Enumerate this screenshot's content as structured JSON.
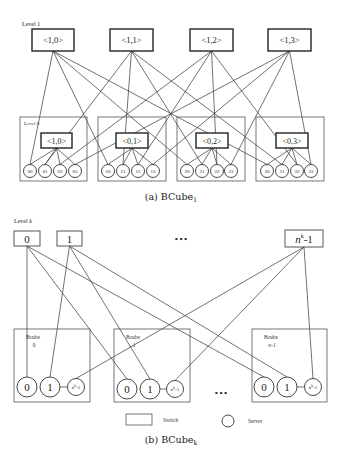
{
  "figure_a": {
    "caption": "(a) BCube",
    "caption_sub": "1",
    "level1_label": "Level 1",
    "level0_label": "Level 0",
    "level1_switches": [
      {
        "label": "<1,0>",
        "x": 32,
        "y": 29,
        "w": 42,
        "h": 22
      },
      {
        "label": "<1,1>",
        "x": 110,
        "y": 29,
        "w": 43,
        "h": 22
      },
      {
        "label": "<1,2>",
        "x": 190,
        "y": 29,
        "w": 43,
        "h": 22
      },
      {
        "label": "<1,3>",
        "x": 268,
        "y": 29,
        "w": 43,
        "h": 22
      }
    ],
    "cells": [
      {
        "box": {
          "x": 20,
          "y": 117,
          "w": 67,
          "h": 64
        },
        "switch": {
          "label": "<1,0>",
          "x": 41,
          "y": 133,
          "w": 31,
          "h": 15
        },
        "servers": [
          {
            "label": "00",
            "cx": 30
          },
          {
            "label": "01",
            "cx": 45
          },
          {
            "label": "02",
            "cx": 60
          },
          {
            "label": "03",
            "cx": 75
          }
        ]
      },
      {
        "box": {
          "x": 98,
          "y": 117,
          "w": 68,
          "h": 64
        },
        "switch": {
          "label": "<0,1>",
          "x": 116,
          "y": 133,
          "w": 32,
          "h": 15
        },
        "servers": [
          {
            "label": "10",
            "cx": 108
          },
          {
            "label": "11",
            "cx": 123
          },
          {
            "label": "12",
            "cx": 138
          },
          {
            "label": "13",
            "cx": 153
          }
        ]
      },
      {
        "box": {
          "x": 177,
          "y": 117,
          "w": 68,
          "h": 64
        },
        "switch": {
          "label": "<0,2>",
          "x": 196,
          "y": 133,
          "w": 32,
          "h": 15
        },
        "servers": [
          {
            "label": "20",
            "cx": 187
          },
          {
            "label": "21",
            "cx": 202
          },
          {
            "label": "22",
            "cx": 217
          },
          {
            "label": "23",
            "cx": 231
          }
        ]
      },
      {
        "box": {
          "x": 256,
          "y": 117,
          "w": 68,
          "h": 64
        },
        "switch": {
          "label": "<0,3>",
          "x": 276,
          "y": 133,
          "w": 32,
          "h": 15
        },
        "servers": [
          {
            "label": "30",
            "cx": 267
          },
          {
            "label": "31",
            "cx": 282
          },
          {
            "label": "32",
            "cx": 297
          },
          {
            "label": "33",
            "cx": 311
          }
        ]
      }
    ],
    "server_cy": 171,
    "server_r": 6.5
  },
  "figure_b": {
    "caption": "(b) BCube",
    "caption_sub": "k",
    "levelk_label": "Level ",
    "levelk_var": "k",
    "ellipsis": "•••",
    "top_switches": [
      {
        "label": "0",
        "x": 14,
        "y": 231,
        "w": 26,
        "h": 15
      },
      {
        "label": "1",
        "x": 57,
        "y": 231,
        "w": 25,
        "h": 15
      },
      {
        "label": "n",
        "sup": "k",
        "suffix": "-1",
        "x": 285,
        "y": 230,
        "w": 38,
        "h": 17
      }
    ],
    "cubes": [
      {
        "title": "Bcube",
        "index": "0",
        "box": {
          "x": 14,
          "y": 329,
          "w": 76,
          "h": 73
        },
        "servers": [
          {
            "label": "0",
            "cx": 27,
            "cy": 387
          },
          {
            "label": "1",
            "cx": 50,
            "cy": 387
          },
          {
            "label": "n",
            "sup": "k",
            "suffix": "-1",
            "cx": 76,
            "cy": 387
          }
        ]
      },
      {
        "title": "Bcube",
        "index": "1",
        "box": {
          "x": 114,
          "y": 329,
          "w": 76,
          "h": 73
        },
        "servers": [
          {
            "label": "0",
            "cx": 127,
            "cy": 389
          },
          {
            "label": "1",
            "cx": 150,
            "cy": 389
          },
          {
            "label": "n",
            "sup": "k",
            "suffix": "-1",
            "cx": 175,
            "cy": 389
          }
        ]
      },
      {
        "title": "Bcube",
        "index": "n-1",
        "box": {
          "x": 252,
          "y": 329,
          "w": 75,
          "h": 73
        },
        "servers": [
          {
            "label": "0",
            "cx": 264,
            "cy": 387
          },
          {
            "label": "1",
            "cx": 287,
            "cy": 387
          },
          {
            "label": "n",
            "sup": "k",
            "suffix": "-1",
            "cx": 313,
            "cy": 387
          }
        ]
      }
    ],
    "legend": {
      "switch_label": "Switch",
      "server_label": "Server"
    }
  }
}
